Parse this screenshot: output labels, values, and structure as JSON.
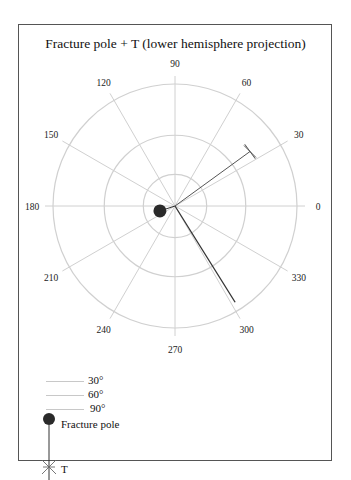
{
  "chart_data": {
    "type": "polar",
    "title": "Fracture pole + T  (lower hemisphere projection)",
    "angular_ticks": [
      "0",
      "30",
      "60",
      "90",
      "120",
      "150",
      "180",
      "210",
      "240",
      "270",
      "300",
      "330"
    ],
    "angular_tick_values": [
      0,
      30,
      60,
      90,
      120,
      150,
      180,
      210,
      240,
      270,
      300,
      330
    ],
    "rings": [
      {
        "label": "30°",
        "radius_frac": 0.26
      },
      {
        "label": "60°",
        "radius_frac": 0.58
      },
      {
        "label": "90°",
        "radius_frac": 1.0
      }
    ],
    "series": [
      {
        "name": "Fracture pole",
        "marker": "filled-circle",
        "angle_deg": 198,
        "radius_frac": 0.13
      },
      {
        "name": "T",
        "marker": "asterisk-cross",
        "angle_deg": 36,
        "radius_frac": 0.76
      }
    ],
    "extra_lines": [
      {
        "from_angle_deg": 0,
        "from_radius_frac": 0,
        "to_angle_deg": 302,
        "to_radius_frac": 0.93
      }
    ],
    "legend_position": "bottom-left",
    "grid": true
  },
  "legend": {
    "ring30": "30°",
    "ring60": "60°",
    "ring90": "90°",
    "pole": "Fracture pole",
    "t": "T"
  },
  "colors": {
    "grid": "#d0d0d0",
    "pole": "#2a2a2a",
    "line": "#333333"
  }
}
